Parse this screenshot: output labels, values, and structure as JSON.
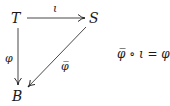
{
  "diagram": {
    "type": "commutative-triangle",
    "nodes": {
      "top_left": "T",
      "top_right": "S",
      "bottom": "B"
    },
    "arrows": [
      {
        "from": "T",
        "to": "S",
        "label": "ι"
      },
      {
        "from": "T",
        "to": "B",
        "label": "φ"
      },
      {
        "from": "S",
        "to": "B",
        "label": "φ̅"
      }
    ],
    "equation": "φ̅ ∘ ι = φ"
  }
}
